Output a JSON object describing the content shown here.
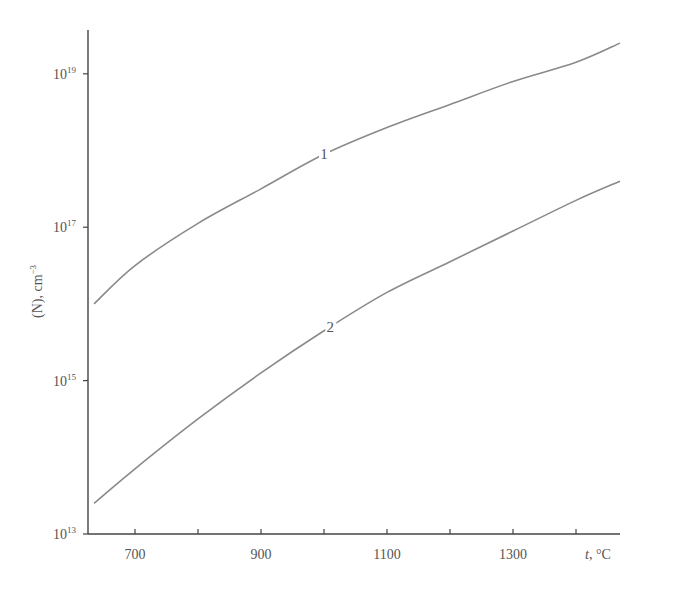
{
  "chart_data": {
    "type": "line",
    "title": "",
    "xlabel": "t, °C",
    "ylabel": "(N), cm⁻³",
    "x_ticks": [
      700,
      800,
      900,
      1000,
      1100,
      1200,
      1300,
      1400
    ],
    "x_tick_labels": [
      "700",
      "900",
      "1100",
      "1300"
    ],
    "xlim": [
      635,
      1475
    ],
    "y_scale": "log",
    "ylim": [
      10000000000000.0,
      1e+20
    ],
    "y_tick_labels": [
      {
        "base": "10",
        "exp": "19"
      },
      {
        "base": "10",
        "exp": "17"
      },
      {
        "base": "10",
        "exp": "15"
      },
      {
        "base": "10",
        "exp": "13"
      }
    ],
    "grid": false,
    "legend": "inline curve labels",
    "series": [
      {
        "name": "1",
        "x": [
          635,
          700,
          800,
          900,
          1000,
          1100,
          1200,
          1300,
          1400,
          1475
        ],
        "log10_values": [
          16.0,
          16.5,
          17.05,
          17.5,
          17.95,
          18.3,
          18.6,
          18.9,
          19.15,
          19.4
        ]
      },
      {
        "name": "2",
        "x": [
          635,
          700,
          800,
          900,
          1000,
          1100,
          1200,
          1300,
          1400,
          1475
        ],
        "log10_values": [
          13.4,
          13.85,
          14.5,
          15.1,
          15.65,
          16.15,
          16.55,
          16.95,
          17.35,
          17.6
        ]
      }
    ]
  },
  "axes": {
    "x_title_italic": "t",
    "x_title_rest": ", °C",
    "y_title": "(N), cm",
    "y_title_exp": "−3"
  },
  "curve_labels": [
    "1",
    "2"
  ]
}
